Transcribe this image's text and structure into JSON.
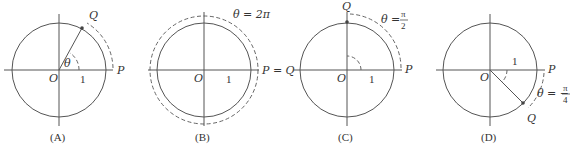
{
  "panels": [
    {
      "id": "A",
      "caption": "(A)",
      "labels": {
        "origin": "O",
        "unit": "1",
        "start": "P",
        "end": "Q",
        "angle": "θ"
      }
    },
    {
      "id": "B",
      "caption": "(B)",
      "labels": {
        "origin": "O",
        "unit": "1",
        "start_end": "P = Q",
        "angle": "θ = 2π"
      }
    },
    {
      "id": "C",
      "caption": "(C)",
      "labels": {
        "origin": "O",
        "unit": "1",
        "start": "P",
        "end": "Q",
        "angle_prefix": "θ =",
        "angle_num": "π",
        "angle_den": "2"
      }
    },
    {
      "id": "D",
      "caption": "(D)",
      "labels": {
        "origin": "O",
        "unit": "1",
        "start": "P",
        "end": "Q",
        "angle_prefix": "θ = −",
        "angle_num": "π",
        "angle_den": "4"
      }
    }
  ],
  "colors": {
    "line": "#555555",
    "text": "#333333",
    "background": "#ffffff"
  }
}
